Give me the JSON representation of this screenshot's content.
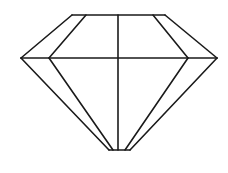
{
  "diagram": {
    "width": 228,
    "height": 173,
    "background": "#ffffff",
    "stroke": "#1a1a1a",
    "stroke_width": 1.6,
    "lines": [
      {
        "name": "table-top-edge",
        "x1": 72,
        "y1": 15,
        "x2": 165,
        "y2": 15
      },
      {
        "name": "crown-left-outer",
        "x1": 72,
        "y1": 15,
        "x2": 21,
        "y2": 58
      },
      {
        "name": "crown-left-inner",
        "x1": 86,
        "y1": 15,
        "x2": 49,
        "y2": 58
      },
      {
        "name": "crown-right-inner",
        "x1": 153,
        "y1": 15,
        "x2": 188,
        "y2": 58
      },
      {
        "name": "crown-right-outer",
        "x1": 165,
        "y1": 15,
        "x2": 217,
        "y2": 58
      },
      {
        "name": "girdle-line",
        "x1": 21,
        "y1": 58,
        "x2": 217,
        "y2": 58
      },
      {
        "name": "center-vertical",
        "x1": 118,
        "y1": 15,
        "x2": 118,
        "y2": 150
      },
      {
        "name": "pavilion-left-outer",
        "x1": 21,
        "y1": 58,
        "x2": 109,
        "y2": 150
      },
      {
        "name": "pavilion-left-inner",
        "x1": 49,
        "y1": 58,
        "x2": 113,
        "y2": 150
      },
      {
        "name": "pavilion-right-inner",
        "x1": 188,
        "y1": 58,
        "x2": 125,
        "y2": 150
      },
      {
        "name": "pavilion-right-outer",
        "x1": 217,
        "y1": 58,
        "x2": 130,
        "y2": 150
      },
      {
        "name": "culet-bottom-edge",
        "x1": 109,
        "y1": 150,
        "x2": 130,
        "y2": 150
      }
    ]
  }
}
